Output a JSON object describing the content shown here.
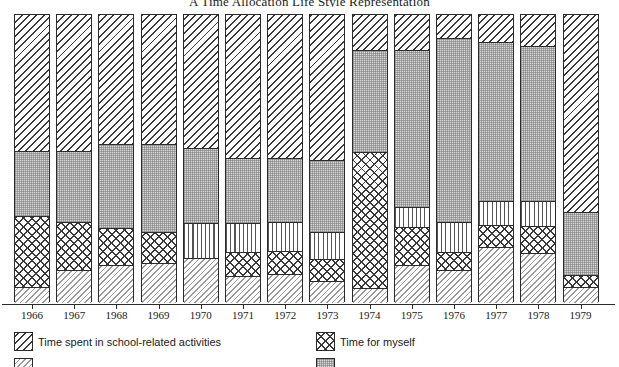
{
  "chart_data": {
    "type": "bar",
    "subtype": "stacked-percentage-bar",
    "title": "A Time Allocation Life Style Representation",
    "xlabel": "",
    "ylabel": "",
    "ylim": [
      0,
      100
    ],
    "grid": false,
    "legend_position": "bottom",
    "categories": [
      "1966",
      "1967",
      "1968",
      "1969",
      "1970",
      "1971",
      "1972",
      "1973",
      "1974",
      "1975",
      "1976",
      "1977",
      "1978",
      "1979"
    ],
    "series": [
      {
        "name": "Time spent in school-related activities",
        "pattern": "diagonal-hatch",
        "values": [
          47,
          47,
          44,
          44,
          46,
          42,
          53,
          50,
          12,
          12,
          8,
          10,
          11,
          58
        ]
      },
      {
        "name": "Time for other people",
        "pattern": "stipple",
        "values": [
          26,
          29,
          24,
          27,
          25,
          23,
          22,
          24,
          35,
          50,
          60,
          54,
          54,
          17
        ]
      },
      {
        "name": "Time for work",
        "pattern": "vertical-lines",
        "values": [
          0,
          0,
          0,
          0,
          11,
          8,
          9,
          10,
          0,
          5,
          10,
          8,
          8,
          0
        ]
      },
      {
        "name": "Time for myself",
        "pattern": "crosshatch",
        "values": [
          23,
          14,
          12,
          10,
          0,
          9,
          7,
          6,
          47,
          20,
          8,
          7,
          9,
          5
        ]
      },
      {
        "name": "Time spent on personal maintenance",
        "pattern": "light-diagonal-hatch",
        "values": [
          4,
          10,
          20,
          19,
          18,
          18,
          9,
          10,
          6,
          13,
          14,
          21,
          18,
          20
        ]
      }
    ],
    "bar_segments": [
      {
        "year": "1966",
        "segments": [
          {
            "series": 0,
            "top": 14,
            "bottom": 151
          },
          {
            "series": 1,
            "top": 151,
            "bottom": 216
          },
          {
            "series": 3,
            "top": 216,
            "bottom": 287
          },
          {
            "series": 4,
            "top": 287,
            "bottom": 302
          }
        ]
      },
      {
        "year": "1967",
        "segments": [
          {
            "series": 0,
            "top": 14,
            "bottom": 151
          },
          {
            "series": 1,
            "top": 151,
            "bottom": 222
          },
          {
            "series": 3,
            "top": 222,
            "bottom": 270
          },
          {
            "series": 4,
            "top": 270,
            "bottom": 302
          }
        ]
      },
      {
        "year": "1968",
        "segments": [
          {
            "series": 0,
            "top": 14,
            "bottom": 144
          },
          {
            "series": 1,
            "top": 144,
            "bottom": 228
          },
          {
            "series": 3,
            "top": 228,
            "bottom": 265
          },
          {
            "series": 4,
            "top": 265,
            "bottom": 302
          }
        ]
      },
      {
        "year": "1969",
        "segments": [
          {
            "series": 0,
            "top": 14,
            "bottom": 144
          },
          {
            "series": 1,
            "top": 144,
            "bottom": 232
          },
          {
            "series": 3,
            "top": 232,
            "bottom": 263
          },
          {
            "series": 4,
            "top": 263,
            "bottom": 302
          }
        ]
      },
      {
        "year": "1970",
        "segments": [
          {
            "series": 0,
            "top": 14,
            "bottom": 148
          },
          {
            "series": 1,
            "top": 148,
            "bottom": 223
          },
          {
            "series": 2,
            "top": 223,
            "bottom": 258
          },
          {
            "series": 4,
            "top": 258,
            "bottom": 302
          }
        ]
      },
      {
        "year": "1971",
        "segments": [
          {
            "series": 0,
            "top": 14,
            "bottom": 158
          },
          {
            "series": 1,
            "top": 158,
            "bottom": 223
          },
          {
            "series": 2,
            "top": 223,
            "bottom": 252
          },
          {
            "series": 3,
            "top": 252,
            "bottom": 276
          },
          {
            "series": 4,
            "top": 276,
            "bottom": 302
          }
        ]
      },
      {
        "year": "1972",
        "segments": [
          {
            "series": 0,
            "top": 14,
            "bottom": 158
          },
          {
            "series": 1,
            "top": 158,
            "bottom": 222
          },
          {
            "series": 2,
            "top": 222,
            "bottom": 251
          },
          {
            "series": 3,
            "top": 251,
            "bottom": 274
          },
          {
            "series": 4,
            "top": 274,
            "bottom": 302
          }
        ]
      },
      {
        "year": "1973",
        "segments": [
          {
            "series": 0,
            "top": 14,
            "bottom": 160
          },
          {
            "series": 1,
            "top": 160,
            "bottom": 232
          },
          {
            "series": 2,
            "top": 232,
            "bottom": 259
          },
          {
            "series": 3,
            "top": 259,
            "bottom": 281
          },
          {
            "series": 4,
            "top": 281,
            "bottom": 302
          }
        ]
      },
      {
        "year": "1974",
        "segments": [
          {
            "series": 0,
            "top": 14,
            "bottom": 50
          },
          {
            "series": 1,
            "top": 50,
            "bottom": 152
          },
          {
            "series": 3,
            "top": 152,
            "bottom": 288
          },
          {
            "series": 4,
            "top": 288,
            "bottom": 302
          }
        ]
      },
      {
        "year": "1975",
        "segments": [
          {
            "series": 0,
            "top": 14,
            "bottom": 50
          },
          {
            "series": 1,
            "top": 50,
            "bottom": 207
          },
          {
            "series": 2,
            "top": 207,
            "bottom": 227
          },
          {
            "series": 3,
            "top": 227,
            "bottom": 265
          },
          {
            "series": 4,
            "top": 265,
            "bottom": 302
          }
        ]
      },
      {
        "year": "1976",
        "segments": [
          {
            "series": 0,
            "top": 14,
            "bottom": 38
          },
          {
            "series": 1,
            "top": 38,
            "bottom": 222
          },
          {
            "series": 2,
            "top": 222,
            "bottom": 252
          },
          {
            "series": 3,
            "top": 252,
            "bottom": 270
          },
          {
            "series": 4,
            "top": 270,
            "bottom": 302
          }
        ]
      },
      {
        "year": "1977",
        "segments": [
          {
            "series": 0,
            "top": 14,
            "bottom": 42
          },
          {
            "series": 1,
            "top": 42,
            "bottom": 201
          },
          {
            "series": 2,
            "top": 201,
            "bottom": 225
          },
          {
            "series": 3,
            "top": 225,
            "bottom": 247
          },
          {
            "series": 4,
            "top": 247,
            "bottom": 302
          }
        ]
      },
      {
        "year": "1978",
        "segments": [
          {
            "series": 0,
            "top": 14,
            "bottom": 46
          },
          {
            "series": 1,
            "top": 46,
            "bottom": 201
          },
          {
            "series": 2,
            "top": 201,
            "bottom": 226
          },
          {
            "series": 3,
            "top": 226,
            "bottom": 253
          },
          {
            "series": 4,
            "top": 253,
            "bottom": 302
          }
        ]
      },
      {
        "year": "1979",
        "segments": [
          {
            "series": 0,
            "top": 14,
            "bottom": 212
          },
          {
            "series": 1,
            "top": 212,
            "bottom": 275
          },
          {
            "series": 3,
            "top": 275,
            "bottom": 287
          },
          {
            "series": 4,
            "top": 287,
            "bottom": 302
          }
        ]
      }
    ]
  },
  "legend": {
    "items": [
      {
        "label": "Time spent in school-related activities",
        "pattern": "diagonal-hatch",
        "x": 14,
        "y": 0
      },
      {
        "label": "Time for myself",
        "pattern": "crosshatch",
        "x": 316,
        "y": 0
      },
      {
        "label": "",
        "pattern": "light-diagonal-hatch",
        "x": 14,
        "y": 26
      },
      {
        "label": "",
        "pattern": "stipple",
        "x": 316,
        "y": 26
      }
    ]
  },
  "geometry": {
    "bar_left_first": 14,
    "bar_width": 36,
    "bar_pitch": 42.2,
    "plot_top": 14,
    "plot_bottom": 302
  }
}
